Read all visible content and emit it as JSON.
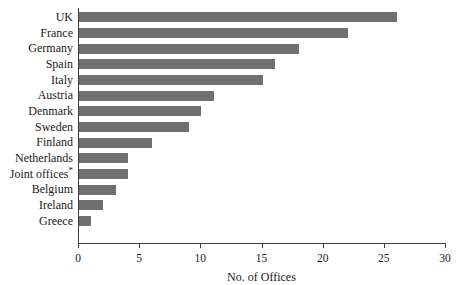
{
  "chart_data": {
    "type": "bar",
    "orientation": "horizontal",
    "title": "",
    "xlabel": "No. of Offices",
    "ylabel": "",
    "xlim": [
      0,
      30
    ],
    "xticks": [
      0,
      5,
      10,
      15,
      20,
      25,
      30
    ],
    "grid": false,
    "legend": null,
    "bar_color": "#6f6f6f",
    "axis_color": "#3d3d3d",
    "categories": [
      "UK",
      "France",
      "Germany",
      "Spain",
      "Italy",
      "Austria",
      "Denmark",
      "Sweden",
      "Finland",
      "Netherlands",
      "Joint offices*",
      "Belgium",
      "Ireland",
      "Greece"
    ],
    "values": [
      26,
      22,
      18,
      16,
      15,
      11,
      10,
      9,
      6,
      4,
      4,
      3,
      2,
      1
    ]
  }
}
